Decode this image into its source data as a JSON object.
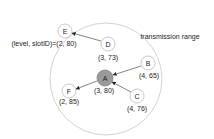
{
  "diagram": {
    "range_label": "transmission range",
    "range_circle": {
      "cx": 106,
      "cy": 79,
      "r": 56,
      "stroke": "#d0d0d0"
    },
    "nodes": [
      {
        "id": "A",
        "label": "A",
        "coord": "(3, 80)",
        "cx": 105,
        "cy": 78,
        "fill": "#9a9a9a"
      },
      {
        "id": "B",
        "label": "B",
        "coord": "(4, 65)",
        "cx": 148,
        "cy": 63,
        "fill": "#ffffff"
      },
      {
        "id": "C",
        "label": "C",
        "coord": "(4, 76)",
        "cx": 137,
        "cy": 96,
        "fill": "#ffffff"
      },
      {
        "id": "D",
        "label": "D",
        "coord": "(3, 73)",
        "cx": 108,
        "cy": 44,
        "fill": "#ffffff"
      },
      {
        "id": "E",
        "label": "E",
        "coord": "(level, slotID)=(2, 80)",
        "cx": 65,
        "cy": 31,
        "fill": "#ffffff"
      },
      {
        "id": "F",
        "label": "F",
        "coord": "(2, 85)",
        "cx": 69,
        "cy": 91,
        "fill": "#ffffff"
      }
    ],
    "edges": [
      {
        "from": "D",
        "to": "E"
      },
      {
        "from": "B",
        "to": "A"
      },
      {
        "from": "C",
        "to": "A"
      },
      {
        "from": "A",
        "to": "F"
      }
    ]
  }
}
